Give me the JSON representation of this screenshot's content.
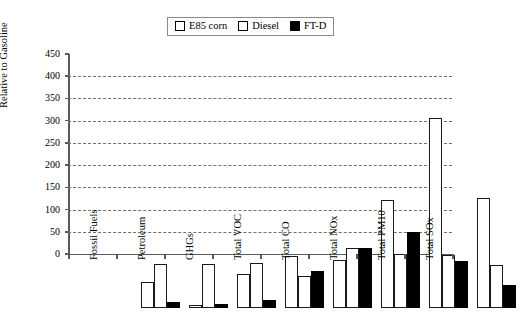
{
  "chart_data": {
    "type": "bar",
    "title": "",
    "xlabel": "",
    "ylabel": "Relative to Gasoline",
    "ylim": [
      0,
      450
    ],
    "ytick_step": 50,
    "yticks": [
      0,
      50,
      100,
      150,
      200,
      250,
      300,
      350,
      400,
      450
    ],
    "grid": true,
    "grid_style": "dashed horizontal",
    "legend_position": "top-center",
    "categories": [
      "Fossil Fuels",
      "Petroleum",
      "GHGs",
      "Total VOC",
      "Total CO",
      "Total NOx",
      "Total PM10",
      "Total SOx"
    ],
    "series": [
      {
        "name": "E85 corn",
        "fill": "white",
        "values": [
          58,
          7,
          77,
          117,
          108,
          243,
          427,
          247
        ]
      },
      {
        "name": "Diesel",
        "fill": "dotted",
        "values": [
          100,
          100,
          102,
          72,
          134,
          122,
          120,
          96
        ]
      },
      {
        "name": "FT-D",
        "fill": "black",
        "values": [
          13,
          8,
          17,
          83,
          134,
          172,
          105,
          52
        ]
      }
    ]
  },
  "legend": {
    "items": [
      {
        "label": "E85 corn",
        "swatch": "swatch-white-outline"
      },
      {
        "label": "Diesel",
        "swatch": "swatch-dotted"
      },
      {
        "label": "FT-D",
        "swatch": "swatch-black"
      }
    ]
  },
  "axes": {
    "y_title": "Relative to Gasoline",
    "y_tick_labels": [
      "0",
      "50",
      "100",
      "150",
      "200",
      "250",
      "300",
      "350",
      "400",
      "450"
    ],
    "x_tick_labels": [
      "Fossil Fuels",
      "Petroleum",
      "GHGs",
      "Total VOC",
      "Total CO",
      "Total NOx",
      "Total PM10",
      "Total SOx"
    ]
  },
  "colors": {
    "axis": "#5a5a5a",
    "grid": "#6f6f6f",
    "bar_outline": "#1a1a1a",
    "series_ftd": "#000000",
    "background": "#ffffff"
  }
}
